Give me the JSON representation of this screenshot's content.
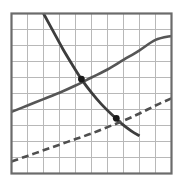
{
  "figure": {
    "title": "",
    "caption": "",
    "background_color": "#ffffff"
  },
  "chart_data": {
    "type": "line",
    "title": "",
    "subtitle": "",
    "xlabel": "",
    "ylabel": "",
    "xlim": [
      0,
      10
    ],
    "ylim": [
      0,
      10
    ],
    "grid": true,
    "grid_columns": 10,
    "grid_rows": 10,
    "grid_color": "#b8b8b8",
    "frame_color": "#6b6b6b",
    "legend": "none",
    "tick_labels_x": [],
    "tick_labels_y": [],
    "annotations": [],
    "series": [
      {
        "name": "rising-solid-curve",
        "style": "solid",
        "color": "#565656",
        "width": 2.6,
        "points": [
          [
            0.0,
            3.85
          ],
          [
            1.0,
            4.25
          ],
          [
            2.0,
            4.65
          ],
          [
            3.0,
            5.05
          ],
          [
            4.0,
            5.5
          ],
          [
            5.0,
            6.0
          ],
          [
            6.0,
            6.5
          ],
          [
            7.0,
            7.1
          ],
          [
            8.0,
            7.7
          ],
          [
            9.0,
            8.35
          ],
          [
            10.0,
            8.6
          ]
        ]
      },
      {
        "name": "falling-solid-curve",
        "style": "solid",
        "color": "#3d3d3d",
        "width": 2.8,
        "points": [
          [
            2.0,
            10.0
          ],
          [
            2.6,
            8.9
          ],
          [
            3.2,
            7.8
          ],
          [
            3.8,
            6.8
          ],
          [
            4.37,
            5.9
          ],
          [
            5.0,
            5.05
          ],
          [
            5.6,
            4.35
          ],
          [
            6.3,
            3.65
          ],
          [
            6.9,
            3.1
          ],
          [
            7.5,
            2.65
          ],
          [
            8.0,
            2.35
          ]
        ]
      },
      {
        "name": "rising-dashed-curve",
        "style": "dashed",
        "color": "#4f4f4f",
        "width": 2.6,
        "dash": [
          7,
          4
        ],
        "points": [
          [
            0.0,
            0.75
          ],
          [
            1.0,
            1.1
          ],
          [
            2.0,
            1.45
          ],
          [
            3.0,
            1.8
          ],
          [
            4.0,
            2.15
          ],
          [
            5.0,
            2.5
          ],
          [
            6.0,
            2.9
          ],
          [
            7.0,
            3.3
          ],
          [
            8.0,
            3.75
          ],
          [
            9.0,
            4.25
          ],
          [
            10.0,
            4.7
          ]
        ]
      }
    ],
    "markers": [
      {
        "name": "upper-intersection-point",
        "x": 4.37,
        "y": 5.9,
        "color": "#1a1a1a",
        "radius": 3.4,
        "label": ""
      },
      {
        "name": "lower-intersection-point",
        "x": 6.55,
        "y": 3.45,
        "color": "#1a1a1a",
        "radius": 3.4,
        "label": ""
      }
    ]
  }
}
